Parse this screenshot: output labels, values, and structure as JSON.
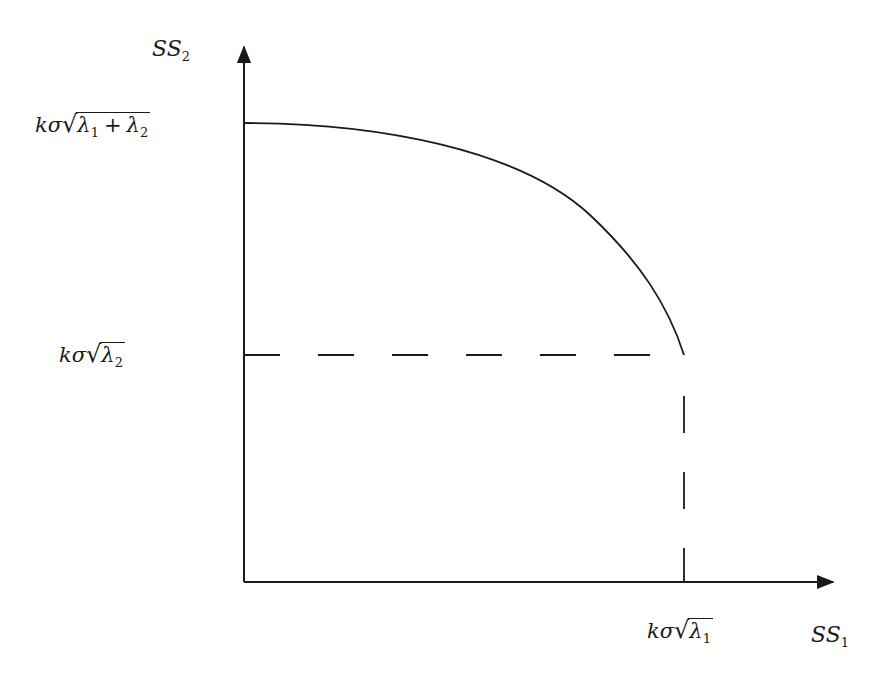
{
  "diagram": {
    "axes": {
      "y_label": {
        "base": "SS",
        "sub": "2"
      },
      "x_label": {
        "base": "SS",
        "sub": "1"
      }
    },
    "y_ticks": [
      {
        "prefix": "kσ",
        "terms": [
          {
            "sym": "λ",
            "sub": "1"
          },
          {
            "sym": "λ",
            "sub": "2"
          }
        ],
        "operator": "+"
      },
      {
        "prefix": "kσ",
        "terms": [
          {
            "sym": "λ",
            "sub": "2"
          }
        ]
      }
    ],
    "x_ticks": [
      {
        "prefix": "kσ",
        "terms": [
          {
            "sym": "λ",
            "sub": "1"
          }
        ]
      }
    ],
    "curve": "concave decreasing boundary from (0, kσ√(λ1+λ2)) to (kσ√λ1, kσ√λ2)",
    "guides": "dashed lines from (kσ√λ1, kσ√λ2) to each axis",
    "colors": {
      "ink": "#1a1a1a",
      "background": "#ffffff"
    }
  }
}
